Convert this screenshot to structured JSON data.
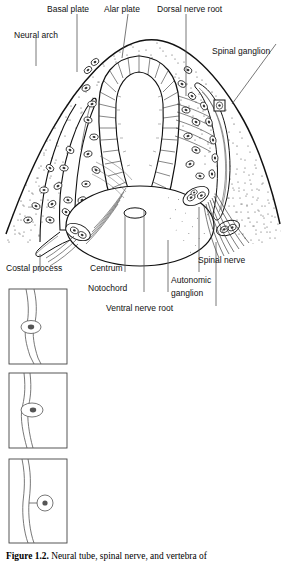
{
  "figure": {
    "number": "Figure 1.2.",
    "caption_text": "Neural tube, spinal nerve, and vertebra of"
  },
  "labels": {
    "neural_arch": "Neural arch",
    "basal_plate": "Basal plate",
    "alar_plate": "Alar plate",
    "dorsal_nerve_root": "Dorsal nerve root",
    "spinal_ganglion": "Spinal ganglion",
    "costal_process": "Costal process",
    "centrum": "Centrum",
    "notochord": "Notochord",
    "autonomic_ganglion_line1": "Autonomic",
    "autonomic_ganglion_line2": "ganglion",
    "spinal_nerve": "Spinal nerve",
    "ventral_nerve_root": "Ventral nerve root"
  },
  "insets": [
    {
      "name": "inset-stage-1",
      "stage": "bipolar spindle-shaped neuroblast"
    },
    {
      "name": "inset-stage-2",
      "stage": "cell body bulging from fiber"
    },
    {
      "name": "inset-stage-3",
      "stage": "unipolar rounded cell on stalk"
    }
  ],
  "colors": {
    "ink": "#111111",
    "line": "#1a1a1a",
    "leader": "#555555",
    "background": "#ffffff"
  }
}
